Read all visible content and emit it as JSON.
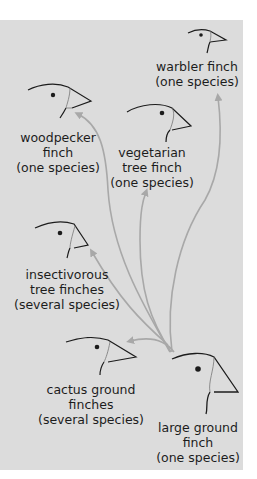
{
  "diagram": {
    "background_color": "#dcdcdc",
    "arrow_color": "#a8a8a8",
    "ancestor": {
      "name": "large ground finch",
      "lines": [
        "large ground",
        "finch",
        "(one species)"
      ]
    },
    "species": [
      {
        "id": "warbler",
        "lines": [
          "warbler finch",
          "(one species)"
        ]
      },
      {
        "id": "woodpecker",
        "lines": [
          "woodpecker",
          "finch",
          "(one species)"
        ]
      },
      {
        "id": "vegetarian",
        "lines": [
          "vegetarian",
          "tree finch",
          "(one species)"
        ]
      },
      {
        "id": "insectivorous",
        "lines": [
          "insectivorous",
          "tree finches",
          "(several species)"
        ]
      },
      {
        "id": "cactus",
        "lines": [
          "cactus ground",
          "finches",
          "(several species)"
        ]
      }
    ],
    "arrows": [
      {
        "from": "large ground finch",
        "to": "warbler finch"
      },
      {
        "from": "large ground finch",
        "to": "woodpecker finch"
      },
      {
        "from": "large ground finch",
        "to": "vegetarian tree finch"
      },
      {
        "from": "large ground finch",
        "to": "insectivorous tree finches"
      },
      {
        "from": "large ground finch",
        "to": "cactus ground finches"
      }
    ]
  }
}
